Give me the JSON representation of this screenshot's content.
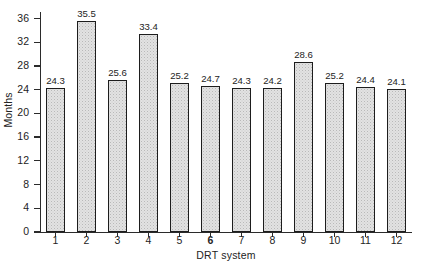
{
  "chart_data": {
    "type": "bar",
    "title": "",
    "subtitle": "",
    "xlabel": "DRT system",
    "ylabel": "Months",
    "categories": [
      "1",
      "2",
      "3",
      "4",
      "5",
      "6",
      "7",
      "8",
      "9",
      "10",
      "11",
      "12"
    ],
    "values": [
      24.3,
      35.5,
      25.6,
      33.4,
      25.2,
      24.7,
      24.3,
      24.2,
      28.6,
      25.2,
      24.4,
      24.1
    ],
    "data_labels": [
      "24.3",
      "35.5",
      "25.6",
      "33.4",
      "25.2",
      "24.7",
      "24.3",
      "24.2",
      "28.6",
      "25.2",
      "24.4",
      "24.1"
    ],
    "emphasized_categories": [
      "6"
    ],
    "ylim": [
      0,
      36
    ],
    "xlim": [
      0,
      12
    ],
    "ytick_labels": [
      "0",
      "4",
      "8",
      "12",
      "16",
      "20",
      "24",
      "28",
      "32",
      "36"
    ],
    "ytick_values": [
      0,
      4,
      8,
      12,
      16,
      20,
      24,
      28,
      32,
      36
    ],
    "grid": false,
    "legend": null,
    "legend_position": "none",
    "bar_fill_color": "#e2e2e2",
    "bar_edge_color": "#1d1d1d",
    "axis_color": "#2b2b2b",
    "background_color": "#ffffff"
  }
}
